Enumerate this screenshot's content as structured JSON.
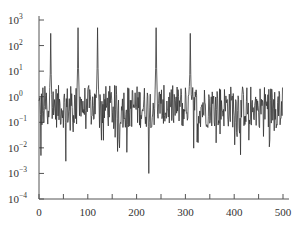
{
  "chart_data": {
    "type": "line",
    "title": "",
    "xlabel": "",
    "ylabel": "",
    "xscale": "linear",
    "yscale": "log",
    "xlim": [
      0,
      510
    ],
    "ylim": [
      0.0001,
      1000
    ],
    "grid": false,
    "legend": null,
    "x_ticks": [
      0,
      100,
      200,
      300,
      400,
      500
    ],
    "x_tick_labels": [
      "0",
      "100",
      "200",
      "300",
      "400",
      "500"
    ],
    "y_ticks": [
      1000,
      100,
      10,
      1,
      0.1,
      0.01,
      0.001,
      0.0001
    ],
    "y_tick_labels": [
      {
        "base": "10",
        "exp": "3"
      },
      {
        "base": "10",
        "exp": "2"
      },
      {
        "base": "10",
        "exp": "1"
      },
      {
        "base": "10",
        "exp": "0"
      },
      {
        "base": "10",
        "exp": "−1"
      },
      {
        "base": "10",
        "exp": "−2"
      },
      {
        "base": "10",
        "exp": "−3"
      },
      {
        "base": "10",
        "exp": "−4"
      }
    ],
    "series": [
      {
        "name": "spectrum",
        "color": "#333333",
        "n_points": 500,
        "baseline_level": 0.5,
        "noise_decades": 1.2,
        "peaks": [
          {
            "x": 24,
            "y": 300
          },
          {
            "x": 80,
            "y": 500
          },
          {
            "x": 120,
            "y": 500
          },
          {
            "x": 240,
            "y": 500
          },
          {
            "x": 310,
            "y": 300
          }
        ],
        "notable_dips": [
          {
            "x": 4,
            "y": 0.005
          },
          {
            "x": 55,
            "y": 0.003
          },
          {
            "x": 128,
            "y": 0.02
          },
          {
            "x": 165,
            "y": 0.01
          },
          {
            "x": 225,
            "y": 0.001
          },
          {
            "x": 310,
            "y": 0.002
          },
          {
            "x": 430,
            "y": 0.02
          }
        ]
      }
    ]
  },
  "colors": {
    "line": "#333333",
    "axis": "#555555",
    "background": "#ffffff"
  }
}
